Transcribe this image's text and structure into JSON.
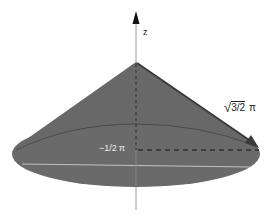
{
  "diagram": {
    "type": "cone-geometry",
    "colors": {
      "cone_fill": "#6b6b6b",
      "cone_side": "#666666",
      "axis": "#777777",
      "arrow": "#333333",
      "background": "#ffffff",
      "highlight_line": "#cfcfcf"
    },
    "axis": {
      "label": "z"
    },
    "slant_label": {
      "radicand": "3/2",
      "symbol": "π",
      "radical": "√"
    },
    "height_label": {
      "value": "−1/2",
      "symbol": "π"
    }
  }
}
